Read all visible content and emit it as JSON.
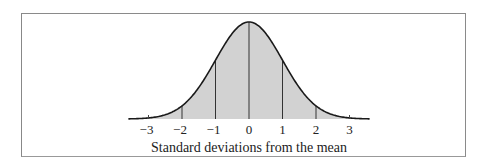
{
  "chart_data": {
    "type": "area",
    "title": "",
    "xlabel": "Standard deviations from the mean",
    "ylabel": "",
    "x_ticks": [
      -3,
      -2,
      -1,
      0,
      1,
      2,
      3
    ],
    "tick_labels": [
      "−3",
      "−2",
      "−1",
      "0",
      "1",
      "2",
      "3"
    ],
    "xlim": [
      -3.6,
      3.6
    ],
    "distribution": "standard normal",
    "mean": 0,
    "sd": 1,
    "shaded_region": [
      -3.6,
      3.6
    ],
    "vertical_lines_at": [
      -2,
      -1,
      0,
      1,
      2
    ],
    "grid": false,
    "legend": null,
    "colors": {
      "fill": "#d2d2d2",
      "curve": "#1a1a1a",
      "frame": "#8a8a8a"
    }
  }
}
